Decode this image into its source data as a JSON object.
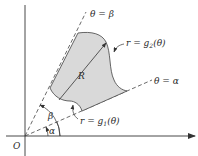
{
  "diagram": {
    "type": "polar-region",
    "colors": {
      "region_fill": "#d9d9d9",
      "region_stroke": "#555555",
      "axis": "#333333",
      "ray": "#444444",
      "text": "#2a2a2a"
    },
    "labels": {
      "origin": "O",
      "region": "R",
      "ray_beta": "θ = β",
      "ray_alpha": "θ = α",
      "outer_curve_prefix": "r = g",
      "outer_curve_sub": "2",
      "outer_curve_suffix": "(θ)",
      "inner_curve_prefix": "r = g",
      "inner_curve_sub": "1",
      "inner_curve_suffix": "(θ)",
      "angle_alpha": "α",
      "angle_beta": "β"
    }
  }
}
